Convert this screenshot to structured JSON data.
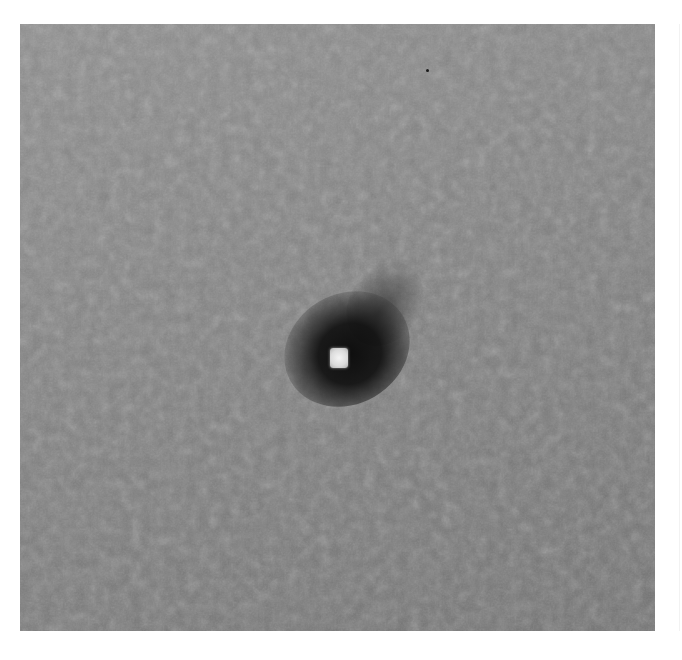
{
  "image": {
    "description": "Grayscale micrograph showing a bright central spot surrounded by a dark halo on a noisy gray background",
    "background_color": "#7f7f7f",
    "halo_color": "#141414",
    "core_color": "#eeeeee",
    "frame": {
      "x": 20,
      "y": 24,
      "width": 635,
      "height": 607
    }
  }
}
